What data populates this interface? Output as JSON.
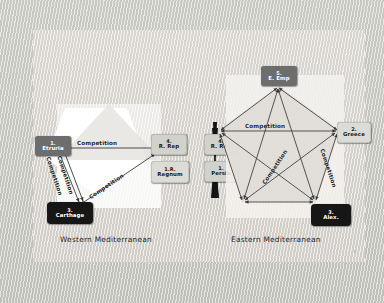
{
  "slide": {
    "background_color": "#cfcfca",
    "panel_color": "#dedbd6",
    "corner_mark": "4"
  },
  "left_diagram": {
    "caption": "Western Mediterranean",
    "shape_color": "#ffffff",
    "nodes": [
      {
        "id": "etruria",
        "num": "1.",
        "name": "Etruria",
        "style": "dark"
      },
      {
        "id": "r-rep",
        "num": "4.",
        "name": "R. Rep",
        "style": "light"
      },
      {
        "id": "regnum",
        "num": "1.R.",
        "name": "Regnum",
        "style": "pale"
      },
      {
        "id": "carthage",
        "num": "3.",
        "name": "Carthage",
        "style": "black"
      }
    ],
    "edge_labels": [
      {
        "id": "top",
        "text": "Competition"
      },
      {
        "id": "left-upper",
        "text": "Competition"
      },
      {
        "id": "left-lower",
        "text": "Competition"
      },
      {
        "id": "diagonal",
        "text": "Competition"
      }
    ]
  },
  "center": {
    "nodes": [
      {
        "id": "c-r-rep",
        "num": "4.",
        "name": "R. Rep",
        "style": "light"
      },
      {
        "id": "c-persia",
        "num": "1.",
        "name": "Persia",
        "style": "light"
      }
    ],
    "divider_color": "#141414"
  },
  "right_diagram": {
    "caption": "Eastern Mediterranean",
    "shape_color": "#f4f2ef",
    "nodes": [
      {
        "id": "e-emp",
        "num": "5.",
        "name": "E. Emp",
        "style": "dark"
      },
      {
        "id": "greece",
        "num": "2.",
        "name": "Greece",
        "style": "pale"
      },
      {
        "id": "alex",
        "num": "3.",
        "name": "Alex.",
        "style": "black"
      }
    ],
    "edge_labels": [
      {
        "id": "horizontal",
        "text": "Competition"
      },
      {
        "id": "diagonal-mid",
        "text": "Competition"
      },
      {
        "id": "diagonal-right",
        "text": "Competition"
      }
    ]
  }
}
